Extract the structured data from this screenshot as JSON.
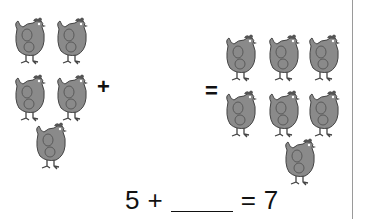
{
  "worksheet": {
    "left_group": {
      "count": 5
    },
    "right_group": {
      "count": 7
    },
    "plus_sign": "+",
    "equals_sign": "=",
    "equation": {
      "addend": "5",
      "plus": "+",
      "blank": "",
      "equals": "=",
      "sum": "7"
    }
  }
}
